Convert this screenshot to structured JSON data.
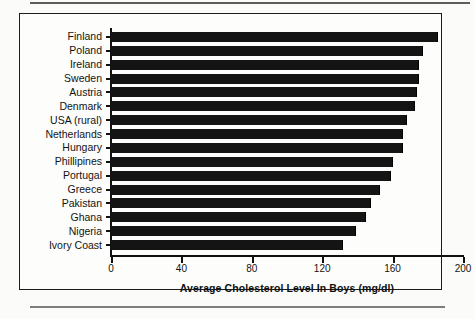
{
  "chart_data": {
    "type": "bar",
    "orientation": "horizontal",
    "title": "",
    "xlabel": "Average Cholesterol Level In Boys (mg/dl)",
    "ylabel": "",
    "xlim": [
      0,
      200
    ],
    "xticks": [
      0,
      40,
      80,
      120,
      160,
      200
    ],
    "xtick_labels": [
      "0",
      "40",
      "80",
      "120",
      "160",
      "200"
    ],
    "grid": false,
    "legend": false,
    "bar_color": "#141414",
    "categories": [
      "Finland",
      "Poland",
      "Ireland",
      "Sweden",
      "Austria",
      "Denmark",
      "USA (rural)",
      "Netherlands",
      "Hungary",
      "Phillipines",
      "Portugal",
      "Greece",
      "Pakistan",
      "Ghana",
      "Nigeria",
      "Ivory Coast"
    ],
    "values": [
      186,
      177,
      175,
      175,
      174,
      173,
      168,
      166,
      166,
      160,
      159,
      153,
      148,
      145,
      139,
      132
    ]
  }
}
